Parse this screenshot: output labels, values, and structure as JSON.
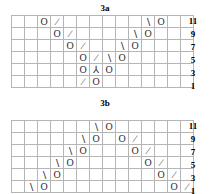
{
  "page": {
    "kind": "knitting-lace-charts",
    "background": "#ffffff",
    "grid_line_color": "#b5b5b5",
    "grid_border_color": "#8a8a8a",
    "symbol_color": "#2a2a2a"
  },
  "symbols": {
    "yo": {
      "name": "yarn-over",
      "glyph": "O"
    },
    "k2tog": {
      "name": "knit-two-together",
      "glyph": "∕"
    },
    "ssk": {
      "name": "slip-slip-knit",
      "glyph": "∖"
    },
    "cdd": {
      "name": "central-double-decrease",
      "glyph": "⅄"
    },
    "blank": {
      "name": "knit-stitch-blank",
      "glyph": ""
    }
  },
  "charts": [
    {
      "id": "3a",
      "title": "3a",
      "columns": 14,
      "rows": 6,
      "row_labels": [
        "11",
        "9",
        "7",
        "5",
        "3",
        "1"
      ],
      "cells": [
        [
          "",
          "",
          "yo",
          "k2tog",
          "",
          "",
          "",
          "",
          "",
          "",
          "ssk",
          "yo",
          "",
          ""
        ],
        [
          "",
          "",
          "",
          "yo",
          "k2tog",
          "",
          "",
          "",
          "",
          "ssk",
          "yo",
          "",
          "",
          ""
        ],
        [
          "",
          "",
          "",
          "",
          "yo",
          "k2tog",
          "",
          "",
          "ssk",
          "yo",
          "",
          "",
          "",
          ""
        ],
        [
          "",
          "",
          "",
          "",
          "",
          "yo",
          "k2tog",
          "ssk",
          "yo",
          "",
          "",
          "",
          "",
          ""
        ],
        [
          "",
          "",
          "",
          "",
          "",
          "yo",
          "cdd",
          "yo",
          "",
          "",
          "",
          "",
          "",
          ""
        ],
        [
          "",
          "",
          "",
          "",
          "",
          "k2tog",
          "yo",
          "",
          "",
          "",
          "",
          "",
          "",
          ""
        ]
      ]
    },
    {
      "id": "3b",
      "title": "3b",
      "columns": 14,
      "rows": 6,
      "row_labels": [
        "11",
        "9",
        "7",
        "5",
        "3",
        "1"
      ],
      "cells": [
        [
          "",
          "",
          "",
          "",
          "",
          "",
          "ssk",
          "yo",
          "",
          "",
          "",
          "",
          "",
          ""
        ],
        [
          "",
          "",
          "",
          "",
          "",
          "ssk",
          "yo",
          "",
          "yo",
          "k2tog",
          "",
          "",
          "",
          ""
        ],
        [
          "",
          "",
          "",
          "",
          "ssk",
          "yo",
          "",
          "",
          "",
          "yo",
          "k2tog",
          "",
          "",
          ""
        ],
        [
          "",
          "",
          "",
          "ssk",
          "yo",
          "",
          "",
          "",
          "",
          "",
          "yo",
          "k2tog",
          "",
          ""
        ],
        [
          "",
          "",
          "ssk",
          "yo",
          "",
          "",
          "",
          "",
          "",
          "",
          "",
          "yo",
          "k2tog",
          ""
        ],
        [
          "",
          "ssk",
          "yo",
          "",
          "",
          "",
          "",
          "",
          "",
          "",
          "",
          "",
          "yo",
          "k2tog"
        ]
      ]
    }
  ]
}
